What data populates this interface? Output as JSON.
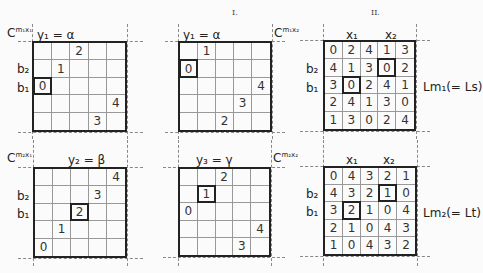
{
  "section_labels": {
    "left": "I.",
    "right": "II."
  },
  "panels": [
    {
      "id": "top-left",
      "corner_label": "C^{m1x1}",
      "corner_base": "C",
      "corner_sup": "m₁x₁",
      "title": "y₁ = α",
      "row_labels": {
        "b2": "b₂",
        "b1": "b₁"
      },
      "cells": [
        [
          "",
          "",
          "2",
          "",
          ""
        ],
        [
          "",
          "1",
          "",
          "",
          ""
        ],
        [
          "0",
          "",
          "",
          "",
          ""
        ],
        [
          "",
          "",
          "",
          "",
          "4"
        ],
        [
          "",
          "",
          "",
          "3",
          ""
        ]
      ],
      "boxed": [
        [
          2,
          0
        ]
      ]
    },
    {
      "id": "top-middle",
      "corner_label": "C^{m1x2}",
      "corner_base": "C",
      "corner_sup": "m₁x₂",
      "title": "y₁ = α",
      "cells": [
        [
          "",
          "1",
          "",
          "",
          ""
        ],
        [
          "0",
          "",
          "",
          "",
          ""
        ],
        [
          "",
          "",
          "",
          "",
          "4"
        ],
        [
          "",
          "",
          "",
          "3",
          ""
        ],
        [
          "",
          "",
          "2",
          "",
          ""
        ]
      ],
      "boxed": [
        [
          1,
          0
        ]
      ]
    },
    {
      "id": "top-right",
      "col_labels": {
        "x1": "x₁",
        "x2": "x₂"
      },
      "row_labels": {
        "b2": "b₂",
        "b1": "b₁"
      },
      "side_label": "Lm₁(= Ls)",
      "cells": [
        [
          "0",
          "2",
          "4",
          "1",
          "3"
        ],
        [
          "4",
          "1",
          "3",
          "0",
          "2"
        ],
        [
          "3",
          "0",
          "2",
          "4",
          "1"
        ],
        [
          "2",
          "4",
          "1",
          "3",
          "0"
        ],
        [
          "1",
          "3",
          "0",
          "2",
          "4"
        ]
      ],
      "boxed": [
        [
          1,
          3
        ],
        [
          2,
          1
        ]
      ]
    },
    {
      "id": "bottom-left",
      "corner_base": "C",
      "corner_sup": "m₂x₁",
      "title": "y₂ = β",
      "row_labels": {
        "b2": "b₂",
        "b1": "b₁"
      },
      "cells": [
        [
          "",
          "",
          "",
          "",
          "4"
        ],
        [
          "",
          "",
          "",
          "3",
          ""
        ],
        [
          "",
          "",
          "2",
          "",
          ""
        ],
        [
          "",
          "1",
          "",
          "",
          ""
        ],
        [
          "0",
          "",
          "",
          "",
          ""
        ]
      ],
      "boxed": [
        [
          2,
          2
        ]
      ]
    },
    {
      "id": "bottom-middle",
      "corner_base": "C",
      "corner_sup": "m₂x₂",
      "title": "y₃ = γ",
      "cells": [
        [
          "",
          "",
          "2",
          "",
          ""
        ],
        [
          "",
          "1",
          "",
          "",
          ""
        ],
        [
          "0",
          "",
          "",
          "",
          ""
        ],
        [
          "",
          "",
          "",
          "",
          "4"
        ],
        [
          "",
          "",
          "",
          "3",
          ""
        ]
      ],
      "boxed": [
        [
          1,
          1
        ]
      ]
    },
    {
      "id": "bottom-right",
      "col_labels": {
        "x1": "x₁",
        "x2": "x₂"
      },
      "row_labels": {
        "b2": "b₂",
        "b1": "b₁"
      },
      "side_label": "Lm₂(= Lt)",
      "cells": [
        [
          "0",
          "4",
          "3",
          "2",
          "1"
        ],
        [
          "4",
          "3",
          "2",
          "1",
          "0"
        ],
        [
          "3",
          "2",
          "1",
          "0",
          "4"
        ],
        [
          "2",
          "1",
          "0",
          "4",
          "3"
        ],
        [
          "1",
          "0",
          "4",
          "3",
          "2"
        ]
      ],
      "boxed": [
        [
          1,
          3
        ],
        [
          2,
          1
        ]
      ]
    }
  ]
}
